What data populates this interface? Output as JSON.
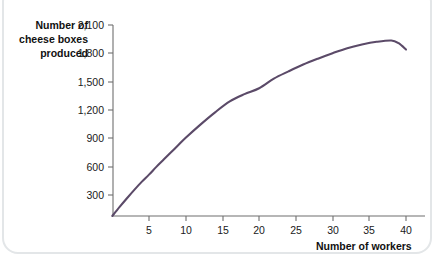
{
  "chart_data": {
    "type": "line",
    "title": "",
    "subtitle": "",
    "xlabel": "Number of workers",
    "ylabel": "Number of cheese boxes produced",
    "ylabel_lines": [
      "Number of",
      "cheese boxes",
      "produced"
    ],
    "xlim": [
      0,
      41
    ],
    "ylim": [
      0,
      2100
    ],
    "grid": false,
    "legend": "none",
    "line_color": "#5b4a68",
    "axis_color": "#6f6f6f",
    "xticks": [
      5,
      10,
      15,
      20,
      25,
      30,
      35,
      40
    ],
    "xtick_labels": [
      "5",
      "10",
      "15",
      "20",
      "25",
      "30",
      "35",
      "40"
    ],
    "yticks": [
      300,
      600,
      900,
      1200,
      1500,
      1800,
      2100
    ],
    "ytick_labels": [
      "300",
      "600",
      "900",
      "1,200",
      "1,500",
      "1,800",
      "2,100"
    ],
    "series": [
      {
        "name": "Total product of labor",
        "x": [
          0,
          1,
          2,
          3,
          4,
          5,
          6,
          7,
          8,
          9,
          10,
          12,
          14,
          16,
          18,
          20,
          22,
          24,
          26,
          28,
          30,
          32,
          34,
          36,
          38,
          39,
          40
        ],
        "values": [
          0,
          100,
          195,
          287,
          375,
          455,
          540,
          620,
          700,
          780,
          860,
          1005,
          1140,
          1260,
          1340,
          1405,
          1510,
          1590,
          1665,
          1730,
          1790,
          1845,
          1885,
          1915,
          1930,
          1900,
          1830
        ]
      }
    ],
    "annotations": []
  },
  "figure": {
    "border_color": "#e3e6e8",
    "background": "#ffffff"
  }
}
